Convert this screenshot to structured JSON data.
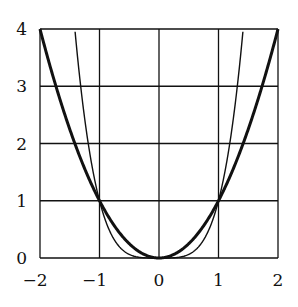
{
  "chart_data": {
    "type": "line",
    "title": "",
    "xlabel": "",
    "ylabel": "",
    "xlim": [
      -2,
      2
    ],
    "ylim": [
      0,
      4
    ],
    "grid": true,
    "legend": null,
    "x_ticks": [
      "−2",
      "−1",
      "0",
      "1",
      "2"
    ],
    "y_ticks": [
      "0",
      "1",
      "2",
      "3",
      "4"
    ],
    "series": [
      {
        "name": "y = x^2",
        "style": "thick",
        "x": [
          -2,
          -1.5,
          -1,
          -0.5,
          0,
          0.5,
          1,
          1.5,
          2
        ],
        "values": [
          4,
          2.25,
          1,
          0.25,
          0,
          0.25,
          1,
          2.25,
          4
        ]
      },
      {
        "name": "y = x^4",
        "style": "thin",
        "x": [
          -1.414,
          -1.2,
          -1,
          -0.5,
          0,
          0.5,
          1,
          1.2,
          1.414
        ],
        "values": [
          4,
          2.07,
          1,
          0.0625,
          0,
          0.0625,
          1,
          2.07,
          4
        ]
      }
    ]
  }
}
